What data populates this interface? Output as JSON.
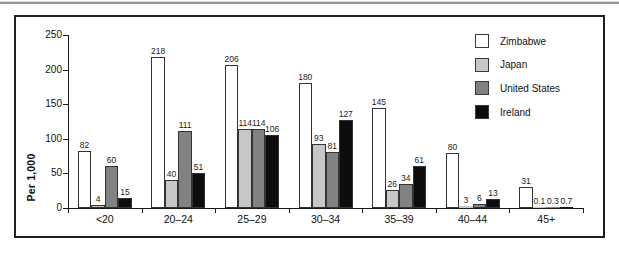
{
  "page": {
    "background": "#ffffff",
    "top_rule_color": "#969696"
  },
  "chart_data": {
    "type": "bar",
    "title": "",
    "xlabel": "",
    "ylabel": "Per 1,000",
    "categories": [
      "<20",
      "20–24",
      "25–29",
      "30–34",
      "35–39",
      "40–44",
      "45+"
    ],
    "series": [
      {
        "name": "Zimbabwe",
        "color": "#ffffff",
        "values": [
          82,
          218,
          206,
          180,
          145,
          80,
          31
        ]
      },
      {
        "name": "Japan",
        "color": "#c7c7c7",
        "values": [
          4,
          40,
          114,
          93,
          26,
          3,
          0.1
        ]
      },
      {
        "name": "United States",
        "color": "#828282",
        "values": [
          60,
          111,
          114,
          81,
          34,
          6,
          0.3
        ]
      },
      {
        "name": "Ireland",
        "color": "#0d0d0d",
        "values": [
          15,
          51,
          106,
          127,
          61,
          13,
          0.7
        ]
      }
    ],
    "yticks": [
      0,
      50,
      100,
      150,
      200,
      250
    ],
    "ylim": [
      0,
      250
    ],
    "grid": false,
    "legend_position": "top-right",
    "bar_outline_color": "#333333",
    "value_labels_shown": true
  }
}
